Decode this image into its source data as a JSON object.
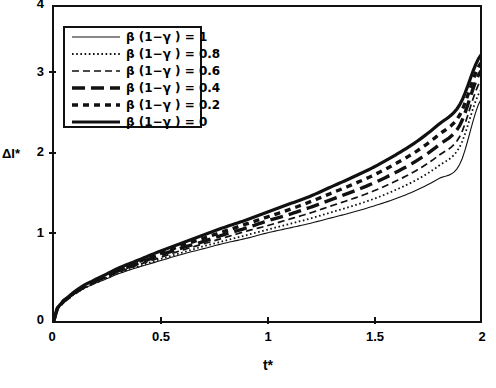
{
  "chart_data": {
    "type": "line",
    "title": "",
    "xlabel": "t*",
    "ylabel": "ΔI*",
    "xlim": [
      0,
      2
    ],
    "ylim": [
      0,
      4
    ],
    "xticks": [
      "0",
      "0.5",
      "1",
      "1.5",
      "2"
    ],
    "xtick_values": [
      0,
      0.5,
      1,
      1.5,
      2
    ],
    "yticks": [
      "0",
      "1",
      "2",
      "3",
      "4"
    ],
    "ytick_values": [
      0,
      1,
      2,
      3,
      4
    ],
    "grid": false,
    "legend_position": "upper-left-inside",
    "x": [
      0,
      0.02,
      0.05,
      0.1,
      0.15,
      0.2,
      0.3,
      0.4,
      0.5,
      0.6,
      0.7,
      0.8,
      0.9,
      1.0,
      1.1,
      1.2,
      1.3,
      1.4,
      1.5,
      1.6,
      1.7,
      1.8,
      1.9,
      2.0
    ],
    "series": [
      {
        "name": "β (1−γ ) = 1",
        "param": 1,
        "style": "thin-solid",
        "values": [
          0,
          0.16,
          0.25,
          0.35,
          0.43,
          0.49,
          0.6,
          0.69,
          0.77,
          0.85,
          0.92,
          0.99,
          1.05,
          1.12,
          1.18,
          1.24,
          1.31,
          1.38,
          1.46,
          1.55,
          1.66,
          1.8,
          1.98,
          2.8
        ]
      },
      {
        "name": "β (1−γ ) = 0.8",
        "param": 0.8,
        "style": "fine-dotted",
        "values": [
          0,
          0.16,
          0.25,
          0.35,
          0.43,
          0.5,
          0.61,
          0.7,
          0.79,
          0.87,
          0.95,
          1.02,
          1.09,
          1.16,
          1.23,
          1.3,
          1.38,
          1.46,
          1.55,
          1.66,
          1.79,
          1.96,
          2.2,
          2.92
        ]
      },
      {
        "name": "β (1−γ ) = 0.6",
        "param": 0.6,
        "style": "dashed",
        "values": [
          0,
          0.16,
          0.26,
          0.36,
          0.44,
          0.51,
          0.62,
          0.72,
          0.81,
          0.9,
          0.98,
          1.06,
          1.14,
          1.21,
          1.29,
          1.37,
          1.46,
          1.55,
          1.65,
          1.77,
          1.91,
          2.09,
          2.33,
          3.04
        ]
      },
      {
        "name": "β (1−γ ) = 0.4",
        "param": 0.4,
        "style": "thick-longdash",
        "values": [
          0,
          0.16,
          0.26,
          0.36,
          0.45,
          0.52,
          0.64,
          0.74,
          0.84,
          0.93,
          1.01,
          1.1,
          1.18,
          1.27,
          1.35,
          1.44,
          1.54,
          1.64,
          1.75,
          1.88,
          2.03,
          2.22,
          2.47,
          3.16
        ]
      },
      {
        "name": "β (1−γ ) = 0.2",
        "param": 0.2,
        "style": "thick-dash",
        "values": [
          0,
          0.17,
          0.27,
          0.37,
          0.46,
          0.53,
          0.65,
          0.76,
          0.86,
          0.96,
          1.05,
          1.14,
          1.23,
          1.32,
          1.41,
          1.51,
          1.62,
          1.73,
          1.85,
          1.99,
          2.15,
          2.35,
          2.6,
          3.26
        ]
      },
      {
        "name": "β (1−γ ) = 0",
        "param": 0,
        "style": "thick-solid",
        "values": [
          0,
          0.17,
          0.27,
          0.38,
          0.47,
          0.54,
          0.67,
          0.78,
          0.89,
          0.99,
          1.09,
          1.19,
          1.28,
          1.38,
          1.48,
          1.58,
          1.7,
          1.82,
          1.95,
          2.1,
          2.27,
          2.48,
          2.73,
          3.36
        ]
      }
    ]
  },
  "legend": {
    "entries": [
      {
        "label": "β (1−γ ) = 1",
        "style": "thin-solid"
      },
      {
        "label": "β (1−γ ) = 0.8",
        "style": "fine-dotted"
      },
      {
        "label": "β (1−γ ) = 0.6",
        "style": "dashed"
      },
      {
        "label": "β (1−γ ) = 0.4",
        "style": "thick-longdash"
      },
      {
        "label": "β (1−γ ) = 0.2",
        "style": "thick-dash"
      },
      {
        "label": "β (1−γ ) = 0",
        "style": "thick-solid"
      }
    ]
  },
  "axes": {
    "y_title": "ΔI*",
    "x_title": "t*",
    "y_tick_labels": [
      "0",
      "1",
      "2",
      "3",
      "4"
    ],
    "x_tick_labels": [
      "0",
      "0.5",
      "1",
      "1.5",
      "2"
    ]
  },
  "colors": {
    "ink": "#111111",
    "background": "#ffffff"
  }
}
